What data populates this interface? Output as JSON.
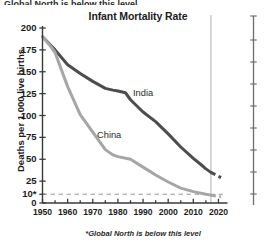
{
  "top_sliver_text": "Global North is below this level",
  "footnote": "*Global North is below this level",
  "colors": {
    "india_line": "#4d4d4d",
    "china_line": "#a6a6a6",
    "axis": "#3a3a3a",
    "threshold_dash": "#9a9a9a",
    "neighbor_axis": "#b8b8b8",
    "background": "#ffffff"
  },
  "axis_labels": {
    "y": [
      "0",
      "10*",
      "25",
      "50",
      "75",
      "100",
      "125",
      "150",
      "175",
      "200"
    ],
    "x": [
      "1950",
      "1960",
      "1970",
      "1980",
      "1990",
      "2000",
      "2010",
      "2020"
    ]
  },
  "series_labels": {
    "india": "India",
    "china": "China"
  },
  "chart_data": {
    "type": "line",
    "title": "Infant Mortality Rate",
    "xlabel": "",
    "ylabel": "Deaths per 1,000 live births",
    "xlim": [
      1950,
      2022
    ],
    "ylim": [
      0,
      200
    ],
    "grid": false,
    "legend": "inline-labels",
    "y_ticks": [
      0,
      10,
      25,
      50,
      75,
      100,
      125,
      150,
      175,
      200
    ],
    "y_tick_labels": [
      "0",
      "10*",
      "25",
      "50",
      "75",
      "100",
      "125",
      "150",
      "175",
      "200"
    ],
    "x_ticks": [
      1950,
      1960,
      1970,
      1980,
      1990,
      2000,
      2010,
      2020
    ],
    "x_minor_tick_step": 5,
    "annotations": [
      {
        "type": "hline",
        "y": 10,
        "style": "dashed",
        "label": "10*",
        "note": "Global North is below this level"
      },
      {
        "type": "vline",
        "x": 2017,
        "style": "solid",
        "color": "#b8b8b8",
        "note": "projection boundary"
      }
    ],
    "series": [
      {
        "name": "India",
        "color": "#4d4d4d",
        "x": [
          1950,
          1955,
          1960,
          1965,
          1970,
          1975,
          1978,
          1980,
          1983,
          1985,
          1990,
          1995,
          2000,
          2005,
          2010,
          2013,
          2015,
          2017
        ],
        "values": [
          190,
          175,
          158,
          148,
          139,
          131,
          129,
          128,
          126,
          118,
          104,
          93,
          79,
          64,
          51,
          44,
          39,
          35
        ],
        "projection": {
          "style": "dashed",
          "x": [
            2017,
            2019,
            2021
          ],
          "values": [
            35,
            32,
            29
          ]
        }
      },
      {
        "name": "China",
        "color": "#a6a6a6",
        "x": [
          1950,
          1953,
          1955,
          1960,
          1965,
          1970,
          1975,
          1978,
          1980,
          1985,
          1990,
          1995,
          2000,
          2005,
          2010,
          2015,
          2017
        ],
        "values": [
          190,
          180,
          172,
          133,
          101,
          81,
          61,
          55,
          53,
          50,
          41,
          32,
          24,
          17,
          13,
          10,
          9
        ],
        "projection": {
          "style": "dashed",
          "x": [
            2017,
            2019,
            2021
          ],
          "values": [
            9,
            8,
            7
          ]
        }
      }
    ]
  }
}
